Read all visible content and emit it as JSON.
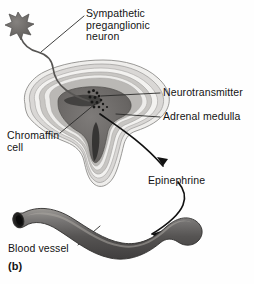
{
  "figure": {
    "panel_label": "(b)",
    "title_implied": "Sympathetic innervation of the adrenal medulla",
    "labels": {
      "sympathetic_neuron": "Sympathetic\npreganglionic\nneuron",
      "neurotransmitter": "Neurotransmitter",
      "adrenal_medulla": "Adrenal medulla",
      "chromaffin_cell": "Chromaffin\ncell",
      "epinephrine": "Epinephrine",
      "blood_vessel": "Blood vessel"
    },
    "icons": {
      "neuron_soma": "star-soma-icon",
      "axon": "axon-line-icon",
      "vesicle_dots": "neurotransmitter-vesicle-icon",
      "arrow_epinephrine": "curved-arrow-icon",
      "arrow_vessel": "curved-arrow-icon",
      "leader_line": "leader-line-icon"
    },
    "colors": {
      "ink": "#131313",
      "capsule_outline": "#8d8d8d",
      "cortex_light": "#f0efee",
      "cortex_mid": "#c9c7c5",
      "cortex_dark": "#a3a09d",
      "medulla": "#6f6c6a",
      "medulla_core": "#3f3d3c",
      "vessel_dark": "#4e4c4b",
      "vessel_mid": "#6b6968",
      "vessel_light": "#96948f",
      "lumen": "#1d1c1c",
      "soma": "#6a6866"
    }
  }
}
